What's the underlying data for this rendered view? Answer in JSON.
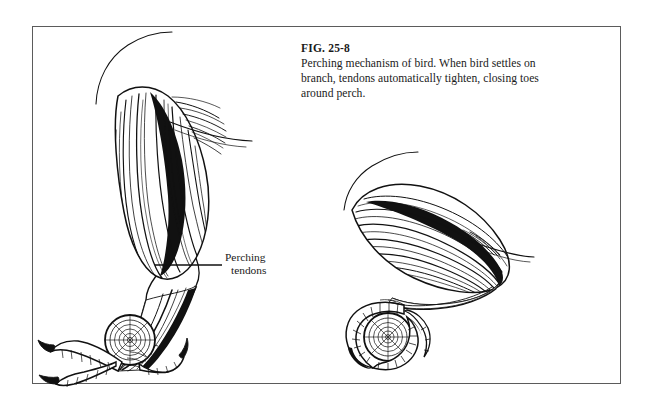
{
  "figure": {
    "caption_title": "FIG. 25-8",
    "caption_body": "Perching mechanism of bird. When bird settles on branch, tendons automatically tighten, closing toes around perch.",
    "callout": {
      "line1": "Perching",
      "line2": "tendons"
    },
    "colors": {
      "ink": "#111111",
      "border": "#5b5b5b",
      "background": "#ffffff"
    },
    "illustrations": [
      {
        "name": "extended-leg",
        "description": "Bird leg in extended standing posture with feathered thigh, tendon lines along tarsus, and toes resting on branch cross-section"
      },
      {
        "name": "flexed-leg",
        "description": "Bird leg in flexed perching posture with toes curled tightly around branch cross-section"
      }
    ]
  }
}
